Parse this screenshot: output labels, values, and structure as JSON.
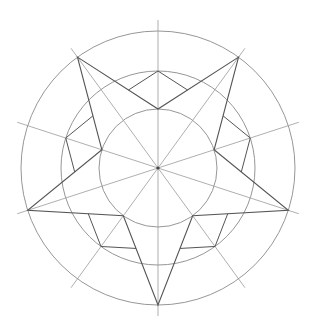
{
  "diagram": {
    "width": 313,
    "height": 332,
    "background": "#ffffff",
    "center": {
      "x": 158,
      "y": 168
    },
    "circles": [
      {
        "name": "outer-circle",
        "r": 137
      },
      {
        "name": "middle-circle",
        "r": 97
      },
      {
        "name": "inner-circle",
        "r": 59
      }
    ],
    "radial_lines": {
      "count": 10,
      "start_angle_deg": 90,
      "step_deg": 36,
      "length": 148
    },
    "star": {
      "points": 5,
      "outer_radius": 137,
      "inner_radius": 59,
      "outer_angles_deg": [
        90,
        162,
        234,
        306,
        18
      ],
      "inner_angles_deg": [
        126,
        198,
        270,
        342,
        54
      ]
    },
    "rhombus_details": {
      "count": 5,
      "tip_radius": 97
    },
    "colors": {
      "guide": "#8a8a8a",
      "ray": "#9a9a9a",
      "star": "#555555",
      "center": "#444444"
    }
  }
}
